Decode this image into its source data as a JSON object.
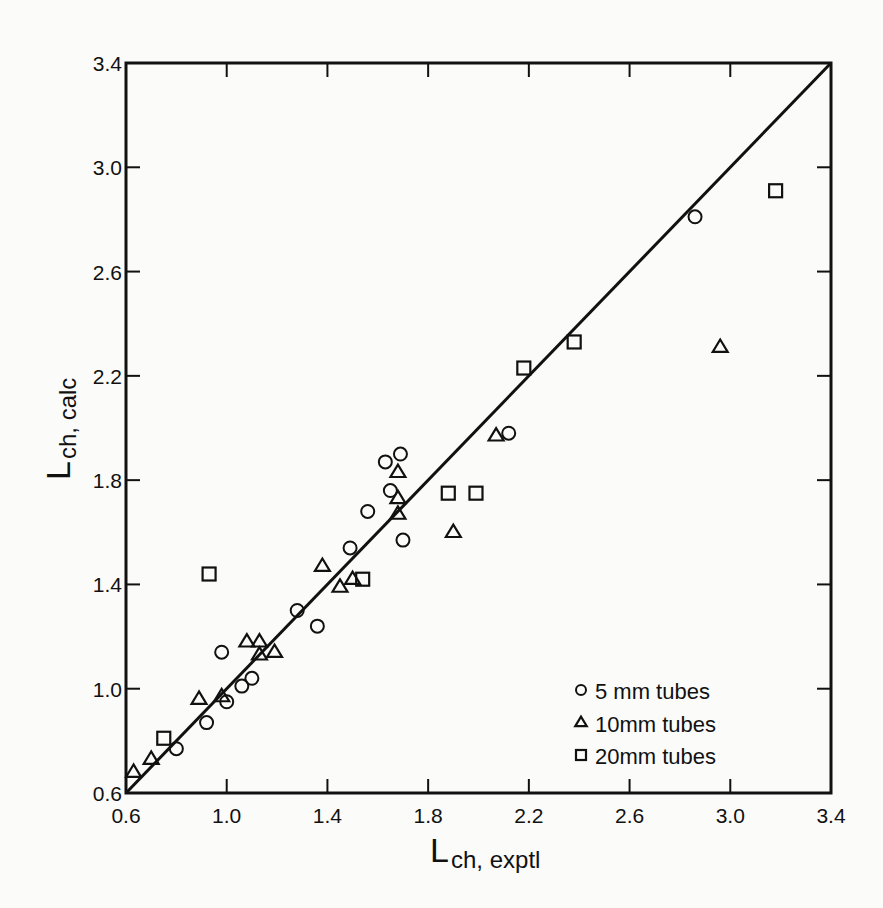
{
  "chart_data": {
    "type": "scatter",
    "title": "",
    "xlabel": "L_ch, exptl",
    "ylabel": "L_ch, calc",
    "xlabel_main": "L",
    "xlabel_sub": "ch, exptl",
    "ylabel_main": "L",
    "ylabel_sub": "ch, calc",
    "xlim": [
      0.6,
      3.4
    ],
    "ylim": [
      0.6,
      3.4
    ],
    "xticks": [
      "0.6",
      "1.0",
      "1.4",
      "1.8",
      "2.2",
      "2.6",
      "3.0",
      "3.4"
    ],
    "yticks": [
      "0.6",
      "1.0",
      "1.4",
      "1.8",
      "2.2",
      "2.6",
      "3.0",
      "3.4"
    ],
    "grid": false,
    "legend_position": "lower right (inside)",
    "reference_line": {
      "label": "y = x",
      "from": [
        0.6,
        0.6
      ],
      "to": [
        3.4,
        3.4
      ]
    },
    "series": [
      {
        "name": "5 mm tubes",
        "marker": "circle",
        "points": [
          [
            0.8,
            0.77
          ],
          [
            0.92,
            0.87
          ],
          [
            0.98,
            1.14
          ],
          [
            1.0,
            0.95
          ],
          [
            1.06,
            1.01
          ],
          [
            1.1,
            1.04
          ],
          [
            1.28,
            1.3
          ],
          [
            1.36,
            1.24
          ],
          [
            1.49,
            1.54
          ],
          [
            1.56,
            1.68
          ],
          [
            1.63,
            1.87
          ],
          [
            1.69,
            1.9
          ],
          [
            1.65,
            1.76
          ],
          [
            1.7,
            1.57
          ],
          [
            2.12,
            1.98
          ],
          [
            2.86,
            2.81
          ]
        ]
      },
      {
        "name": "10mm tubes",
        "marker": "triangle",
        "points": [
          [
            0.63,
            0.68
          ],
          [
            0.7,
            0.73
          ],
          [
            0.89,
            0.96
          ],
          [
            0.98,
            0.97
          ],
          [
            1.08,
            1.18
          ],
          [
            1.13,
            1.18
          ],
          [
            1.13,
            1.13
          ],
          [
            1.19,
            1.14
          ],
          [
            1.38,
            1.47
          ],
          [
            1.45,
            1.39
          ],
          [
            1.5,
            1.42
          ],
          [
            1.68,
            1.83
          ],
          [
            1.68,
            1.73
          ],
          [
            1.68,
            1.67
          ],
          [
            1.9,
            1.6
          ],
          [
            2.07,
            1.97
          ],
          [
            2.96,
            2.31
          ]
        ]
      },
      {
        "name": "20mm tubes",
        "marker": "square",
        "points": [
          [
            0.75,
            0.81
          ],
          [
            0.93,
            1.44
          ],
          [
            1.54,
            1.42
          ],
          [
            1.88,
            1.75
          ],
          [
            1.99,
            1.75
          ],
          [
            2.18,
            2.23
          ],
          [
            2.38,
            2.33
          ],
          [
            3.18,
            2.91
          ]
        ]
      }
    ]
  },
  "legend": {
    "items": [
      {
        "marker": "circle",
        "label": "5 mm tubes"
      },
      {
        "marker": "triangle",
        "label": "10mm tubes"
      },
      {
        "marker": "square",
        "label": "20mm tubes"
      }
    ]
  },
  "colors": {
    "ink": "#111111",
    "paper": "#fbfbf9"
  }
}
